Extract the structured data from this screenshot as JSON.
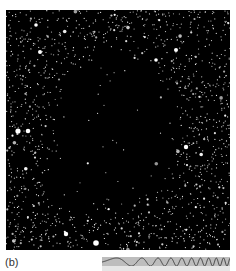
{
  "figure": {
    "panel_label": "(b)",
    "image": {
      "subject": "dark-nebula-star-field",
      "background_color": "#000000",
      "star_color": "#ffffff"
    },
    "chirp_strip": {
      "fill_color": "#bdbdbd",
      "wave_color": "#333333"
    }
  }
}
